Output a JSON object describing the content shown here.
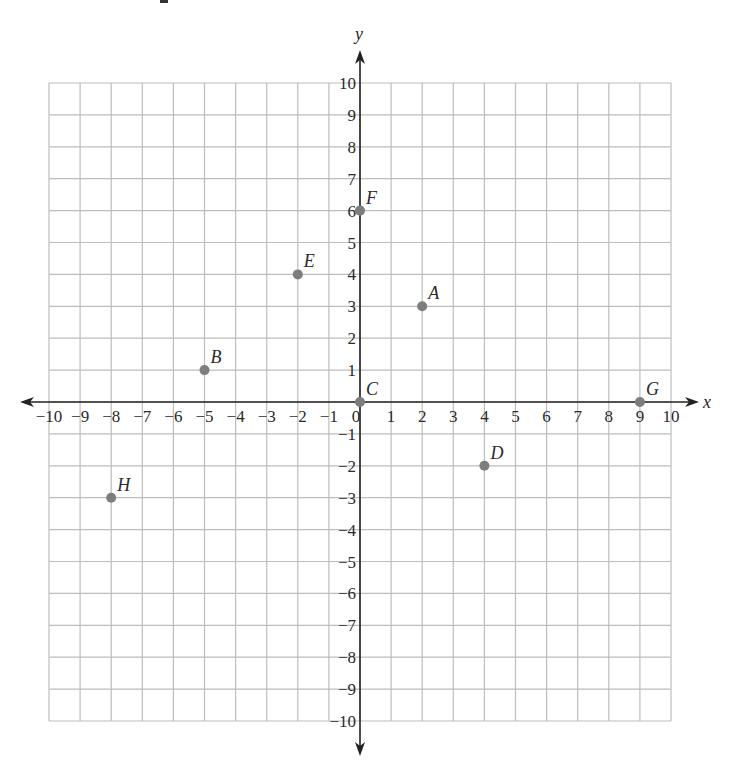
{
  "chart_data": {
    "type": "scatter",
    "title": "",
    "xlabel": "x",
    "ylabel": "y",
    "xlim": [
      -10,
      10
    ],
    "ylim": [
      -10,
      10
    ],
    "grid": true,
    "x_ticks": [
      -10,
      -9,
      -8,
      -7,
      -6,
      -5,
      -4,
      -3,
      -2,
      -1,
      0,
      1,
      2,
      3,
      4,
      5,
      6,
      7,
      8,
      9,
      10
    ],
    "y_ticks": [
      10,
      9,
      8,
      7,
      6,
      5,
      4,
      3,
      2,
      1,
      -1,
      -2,
      -3,
      -4,
      -5,
      -6,
      -7,
      -8,
      -9,
      -10
    ],
    "points": [
      {
        "label": "A",
        "x": 2,
        "y": 3
      },
      {
        "label": "B",
        "x": -5,
        "y": 1
      },
      {
        "label": "C",
        "x": 0,
        "y": 0
      },
      {
        "label": "D",
        "x": 4,
        "y": -2
      },
      {
        "label": "E",
        "x": -2,
        "y": 4
      },
      {
        "label": "F",
        "x": 0,
        "y": 6
      },
      {
        "label": "G",
        "x": 9,
        "y": 0
      },
      {
        "label": "H",
        "x": -8,
        "y": -3
      }
    ],
    "colors": {
      "point": "#7d7d7d",
      "grid": "#bdbdbd",
      "axis": "#222222"
    }
  },
  "labels": {
    "x_axis": "x",
    "y_axis": "y"
  }
}
